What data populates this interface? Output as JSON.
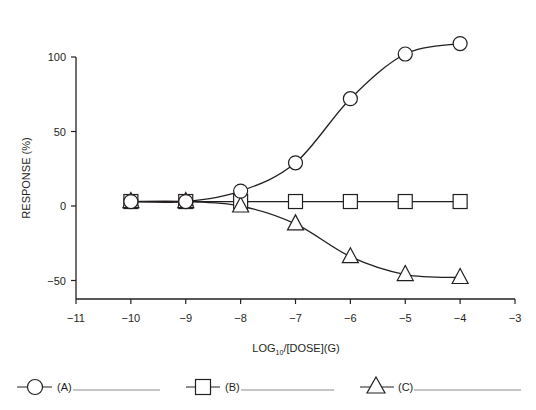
{
  "chart_data": {
    "type": "line",
    "title": "",
    "xlabel": "LOG10/[DOSE](G)",
    "xlabel_parts": {
      "pre": "LOG",
      "sub": "10",
      "post": "/[DOSE](G)"
    },
    "ylabel": "RESPONSE (%)",
    "xlim": [
      -11,
      -3
    ],
    "ylim": [
      -62,
      120
    ],
    "x_ticks": [
      -11,
      -10,
      -9,
      -8,
      -7,
      -6,
      -5,
      -4,
      -3
    ],
    "x_tick_labels": [
      "−11",
      "−10",
      "−9",
      "−8",
      "−7",
      "−6",
      "−5",
      "−4",
      "−3"
    ],
    "y_ticks": [
      100,
      50,
      0,
      -50
    ],
    "y_tick_labels": [
      "100",
      "50",
      "0",
      "−50"
    ],
    "grid": false,
    "legend_position": "bottom",
    "x": [
      -10,
      -9,
      -8,
      -7,
      -6,
      -5,
      -4
    ],
    "series": [
      {
        "name": "(A)",
        "marker": "circle",
        "values": [
          3,
          3,
          10,
          29,
          72,
          102,
          109
        ]
      },
      {
        "name": "(B)",
        "marker": "square",
        "values": [
          3,
          3,
          3,
          3,
          3,
          3,
          3
        ]
      },
      {
        "name": "(C)",
        "marker": "triangle",
        "values": [
          3,
          3,
          0,
          -12,
          -34,
          -46,
          -48
        ]
      }
    ]
  },
  "legend": {
    "a_label": "(A)",
    "b_label": "(B)",
    "c_label": "(C)"
  }
}
